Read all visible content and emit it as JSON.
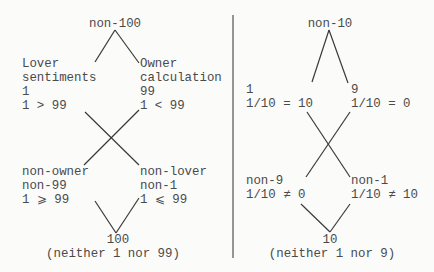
{
  "left": {
    "top": "non-100",
    "upper_left": [
      "Lover",
      "sentiments",
      "1",
      "1 > 99"
    ],
    "upper_right": [
      "Owner",
      "calculation",
      "99",
      "1 < 99"
    ],
    "lower_left": [
      "non-owner",
      "non-99",
      "1 ⩾ 99"
    ],
    "lower_right": [
      "non-lover",
      "non-1",
      "1 ⩽ 99"
    ],
    "bottom": "100",
    "bottom_note": "(neither 1 nor 99)"
  },
  "right": {
    "top": "non-10",
    "upper_left": [
      "1",
      "1/10 = 10"
    ],
    "upper_right": [
      "9",
      "1/10 = 0"
    ],
    "lower_left": [
      "non-9",
      "1/10 ≠ 0"
    ],
    "lower_right": [
      "non-1",
      "1/10 ≠ 10"
    ],
    "bottom": "10",
    "bottom_note": "(neither 1 nor 9)"
  }
}
